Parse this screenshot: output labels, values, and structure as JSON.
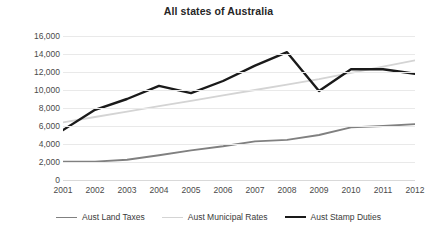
{
  "chart_data": {
    "type": "line",
    "title": "All states of Australia",
    "xlabel": "",
    "ylabel": "",
    "categories": [
      "2001",
      "2002",
      "2003",
      "2004",
      "2005",
      "2006",
      "2007",
      "2008",
      "2009",
      "2010",
      "2011",
      "2012"
    ],
    "ylim": [
      0,
      16000
    ],
    "yticks": [
      0,
      2000,
      4000,
      6000,
      8000,
      10000,
      12000,
      14000,
      16000
    ],
    "ytick_labels": [
      "0",
      "2,000",
      "4,000",
      "6,000",
      "8,000",
      "10,000",
      "12,000",
      "14,000",
      "16,000"
    ],
    "grid": true,
    "legend_position": "bottom",
    "series": [
      {
        "name": "Aust Land Taxes",
        "color": "#808080",
        "width": 1.8,
        "values": [
          2050,
          2050,
          2250,
          2750,
          3300,
          3750,
          4300,
          4450,
          5000,
          5850,
          6000,
          6200
        ]
      },
      {
        "name": "Aust Municipal Rates",
        "color": "#d4d4d4",
        "width": 1.8,
        "values": [
          6400,
          7000,
          7600,
          8200,
          8800,
          9400,
          10000,
          10600,
          11200,
          11900,
          12600,
          13300
        ]
      },
      {
        "name": "Aust Stamp Duties",
        "color": "#1a1a1a",
        "width": 2.4,
        "values": [
          5550,
          7800,
          9000,
          10450,
          9650,
          11000,
          12700,
          14200,
          9900,
          12300,
          12300,
          11800
        ]
      }
    ]
  },
  "axis": {
    "grid_color": "#e9e9e9",
    "label_color": "#4a4a4a"
  }
}
